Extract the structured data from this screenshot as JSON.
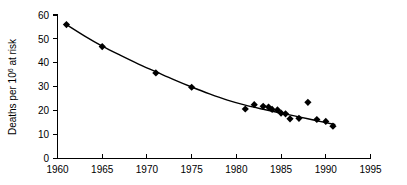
{
  "chart_data": {
    "type": "scatter",
    "title": "",
    "xlabel": "",
    "ylabel": "Deaths per 10⁶ at risk",
    "ylabel_base": "Deaths per 10",
    "ylabel_exponent": "6",
    "ylabel_tail": " at risk",
    "xlim": [
      1960,
      1995
    ],
    "ylim": [
      0,
      60
    ],
    "grid": false,
    "legend": "none",
    "xticks": [
      1960,
      1965,
      1970,
      1975,
      1980,
      1985,
      1990,
      1995
    ],
    "xtick_labels": [
      "1960",
      "1965",
      "1970",
      "1975",
      "1980",
      "1985",
      "1990",
      "1995"
    ],
    "yticks": [
      0,
      10,
      20,
      30,
      40,
      50,
      60
    ],
    "ytick_labels": [
      "0",
      "10",
      "20",
      "30",
      "40",
      "50",
      "60"
    ],
    "marker": "diamond",
    "marker_color": "#000000",
    "curve_color": "#000000",
    "series": [
      {
        "name": "Deaths per million at risk",
        "x": [
          1961,
          1965,
          1971,
          1975,
          1981,
          1982,
          1983,
          1983.6,
          1984,
          1984.6,
          1985,
          1985.5,
          1986,
          1987,
          1988,
          1989,
          1990,
          1990.8
        ],
        "values": [
          56.0,
          46.8,
          35.8,
          29.8,
          20.7,
          22.5,
          21.8,
          21.5,
          20.5,
          20.3,
          19.0,
          18.7,
          16.6,
          16.8,
          23.5,
          16.3,
          15.5,
          13.5
        ]
      }
    ],
    "fitted_curve": {
      "name": "fitted trend",
      "x": [
        1961,
        1963,
        1965,
        1967,
        1969,
        1971,
        1973,
        1975,
        1977,
        1979,
        1981,
        1983,
        1985,
        1987,
        1989,
        1991
      ],
      "values": [
        56.0,
        51.3,
        47.0,
        43.2,
        39.6,
        36.3,
        33.0,
        29.9,
        27.0,
        24.4,
        22.3,
        20.6,
        19.0,
        17.4,
        15.8,
        14.2
      ]
    }
  }
}
